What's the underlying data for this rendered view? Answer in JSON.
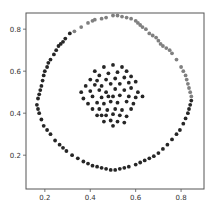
{
  "chart_data": {
    "type": "scatter",
    "title": "",
    "xlabel": "",
    "ylabel": "",
    "xlim": [
      0.117,
      0.901
    ],
    "ylim": [
      0.039,
      0.877
    ],
    "grid": false,
    "legend": null,
    "xticks": [
      0.2,
      0.4,
      0.6,
      0.8
    ],
    "xtick_labels": [
      "0.2",
      "0.4",
      "0.6",
      "0.8"
    ],
    "yticks": [
      0.2,
      0.4,
      0.6,
      0.8
    ],
    "ytick_labels": [
      "0.2",
      "0.4",
      "0.6",
      "0.8"
    ],
    "series": [
      {
        "name": "outer ring (upper arc)",
        "color": "#808080",
        "points": [
          [
            0.33,
            0.79
          ],
          [
            0.36,
            0.81
          ],
          [
            0.39,
            0.83
          ],
          [
            0.41,
            0.84
          ],
          [
            0.42,
            0.845
          ],
          [
            0.45,
            0.85
          ],
          [
            0.47,
            0.855
          ],
          [
            0.5,
            0.865
          ],
          [
            0.52,
            0.865
          ],
          [
            0.54,
            0.86
          ],
          [
            0.56,
            0.855
          ],
          [
            0.58,
            0.85
          ],
          [
            0.6,
            0.84
          ],
          [
            0.61,
            0.83
          ],
          [
            0.62,
            0.82
          ],
          [
            0.63,
            0.81
          ],
          [
            0.645,
            0.8
          ],
          [
            0.66,
            0.78
          ],
          [
            0.675,
            0.77
          ],
          [
            0.69,
            0.76
          ],
          [
            0.7,
            0.745
          ],
          [
            0.71,
            0.73
          ],
          [
            0.72,
            0.72
          ],
          [
            0.735,
            0.71
          ],
          [
            0.75,
            0.7
          ],
          [
            0.76,
            0.685
          ],
          [
            0.78,
            0.655
          ],
          [
            0.8,
            0.62
          ],
          [
            0.81,
            0.6
          ],
          [
            0.82,
            0.58
          ],
          [
            0.825,
            0.56
          ],
          [
            0.83,
            0.54
          ],
          [
            0.835,
            0.52
          ],
          [
            0.84,
            0.5
          ],
          [
            0.845,
            0.48
          ]
        ]
      },
      {
        "name": "outer ring (lower arc)",
        "color": "#262626",
        "points": [
          [
            0.31,
            0.78
          ],
          [
            0.29,
            0.755
          ],
          [
            0.28,
            0.74
          ],
          [
            0.27,
            0.73
          ],
          [
            0.26,
            0.72
          ],
          [
            0.25,
            0.7
          ],
          [
            0.24,
            0.68
          ],
          [
            0.225,
            0.655
          ],
          [
            0.215,
            0.64
          ],
          [
            0.21,
            0.62
          ],
          [
            0.2,
            0.6
          ],
          [
            0.195,
            0.58
          ],
          [
            0.19,
            0.555
          ],
          [
            0.185,
            0.53
          ],
          [
            0.18,
            0.51
          ],
          [
            0.175,
            0.49
          ],
          [
            0.17,
            0.47
          ],
          [
            0.165,
            0.44
          ],
          [
            0.17,
            0.42
          ],
          [
            0.175,
            0.4
          ],
          [
            0.185,
            0.37
          ],
          [
            0.195,
            0.34
          ],
          [
            0.21,
            0.32
          ],
          [
            0.225,
            0.3
          ],
          [
            0.245,
            0.27
          ],
          [
            0.265,
            0.25
          ],
          [
            0.28,
            0.235
          ],
          [
            0.295,
            0.22
          ],
          [
            0.32,
            0.2
          ],
          [
            0.345,
            0.185
          ],
          [
            0.37,
            0.17
          ],
          [
            0.39,
            0.16
          ],
          [
            0.41,
            0.15
          ],
          [
            0.43,
            0.145
          ],
          [
            0.45,
            0.14
          ],
          [
            0.47,
            0.135
          ],
          [
            0.49,
            0.13
          ],
          [
            0.51,
            0.13
          ],
          [
            0.53,
            0.135
          ],
          [
            0.55,
            0.14
          ],
          [
            0.57,
            0.145
          ],
          [
            0.6,
            0.155
          ],
          [
            0.62,
            0.165
          ],
          [
            0.64,
            0.175
          ],
          [
            0.66,
            0.185
          ],
          [
            0.68,
            0.195
          ],
          [
            0.7,
            0.21
          ],
          [
            0.72,
            0.23
          ],
          [
            0.74,
            0.25
          ],
          [
            0.76,
            0.275
          ],
          [
            0.78,
            0.3
          ],
          [
            0.795,
            0.32
          ],
          [
            0.81,
            0.35
          ],
          [
            0.82,
            0.375
          ],
          [
            0.83,
            0.4
          ],
          [
            0.835,
            0.42
          ],
          [
            0.84,
            0.44
          ],
          [
            0.845,
            0.46
          ]
        ]
      },
      {
        "name": "inner cluster",
        "color": "#262626",
        "points": [
          [
            0.42,
            0.6
          ],
          [
            0.46,
            0.62
          ],
          [
            0.5,
            0.63
          ],
          [
            0.54,
            0.62
          ],
          [
            0.44,
            0.58
          ],
          [
            0.48,
            0.59
          ],
          [
            0.52,
            0.595
          ],
          [
            0.56,
            0.6
          ],
          [
            0.4,
            0.56
          ],
          [
            0.43,
            0.555
          ],
          [
            0.47,
            0.56
          ],
          [
            0.51,
            0.565
          ],
          [
            0.55,
            0.57
          ],
          [
            0.58,
            0.575
          ],
          [
            0.38,
            0.53
          ],
          [
            0.42,
            0.535
          ],
          [
            0.45,
            0.53
          ],
          [
            0.49,
            0.54
          ],
          [
            0.53,
            0.54
          ],
          [
            0.57,
            0.545
          ],
          [
            0.6,
            0.55
          ],
          [
            0.36,
            0.5
          ],
          [
            0.4,
            0.505
          ],
          [
            0.44,
            0.51
          ],
          [
            0.47,
            0.5
          ],
          [
            0.51,
            0.515
          ],
          [
            0.55,
            0.51
          ],
          [
            0.58,
            0.52
          ],
          [
            0.61,
            0.5
          ],
          [
            0.37,
            0.47
          ],
          [
            0.41,
            0.48
          ],
          [
            0.45,
            0.475
          ],
          [
            0.48,
            0.48
          ],
          [
            0.5,
            0.48
          ],
          [
            0.53,
            0.485
          ],
          [
            0.57,
            0.48
          ],
          [
            0.6,
            0.475
          ],
          [
            0.63,
            0.48
          ],
          [
            0.39,
            0.445
          ],
          [
            0.43,
            0.45
          ],
          [
            0.46,
            0.445
          ],
          [
            0.49,
            0.455
          ],
          [
            0.52,
            0.45
          ],
          [
            0.56,
            0.455
          ],
          [
            0.59,
            0.445
          ],
          [
            0.41,
            0.42
          ],
          [
            0.44,
            0.42
          ],
          [
            0.475,
            0.415
          ],
          [
            0.51,
            0.42
          ],
          [
            0.54,
            0.415
          ],
          [
            0.58,
            0.42
          ],
          [
            0.43,
            0.39
          ],
          [
            0.45,
            0.39
          ],
          [
            0.47,
            0.39
          ],
          [
            0.5,
            0.395
          ],
          [
            0.53,
            0.39
          ],
          [
            0.56,
            0.385
          ],
          [
            0.46,
            0.36
          ],
          [
            0.49,
            0.365
          ],
          [
            0.52,
            0.36
          ],
          [
            0.55,
            0.355
          ],
          [
            0.5,
            0.34
          ]
        ]
      }
    ]
  },
  "axes": {
    "frame_color": "#555555",
    "background": "#ffffff"
  }
}
